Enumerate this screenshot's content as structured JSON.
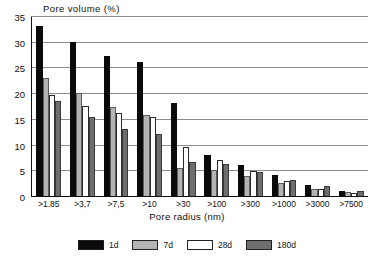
{
  "chart_data": {
    "type": "bar",
    "title": "Pore volume (%)",
    "xlabel": "Pore radius (nm)",
    "ylabel": "",
    "ylim": [
      0,
      35
    ],
    "yticks": [
      0,
      5,
      10,
      15,
      20,
      25,
      30,
      35
    ],
    "grid": true,
    "legend_position": "bottom",
    "categories": [
      ">1.85",
      ">3,7",
      ">7,5",
      ">10",
      ">30",
      ">100",
      ">300",
      ">1000",
      ">3000",
      ">7500"
    ],
    "series": [
      {
        "name": "1d",
        "color": "#0a0a0a",
        "values": [
          33.0,
          30.0,
          27.3,
          26.0,
          18.0,
          8.0,
          6.0,
          4.0,
          2.2,
          1.0
        ]
      },
      {
        "name": "7d",
        "color": "#b4b4b4",
        "values": [
          23.0,
          20.1,
          17.4,
          15.8,
          5.5,
          5.1,
          3.9,
          2.6,
          1.3,
          0.7
        ]
      },
      {
        "name": "28d",
        "color": "#ffffff",
        "values": [
          19.6,
          17.6,
          16.1,
          15.4,
          9.6,
          7.0,
          4.8,
          3.0,
          1.4,
          0.6
        ]
      },
      {
        "name": "180d",
        "color": "#6e6e6e",
        "values": [
          18.4,
          15.3,
          13.1,
          12.0,
          6.7,
          6.3,
          4.6,
          3.2,
          2.0,
          0.9
        ]
      }
    ]
  },
  "legend": {
    "items": [
      {
        "label": "1d"
      },
      {
        "label": "7d"
      },
      {
        "label": "28d"
      },
      {
        "label": "180d"
      }
    ]
  }
}
